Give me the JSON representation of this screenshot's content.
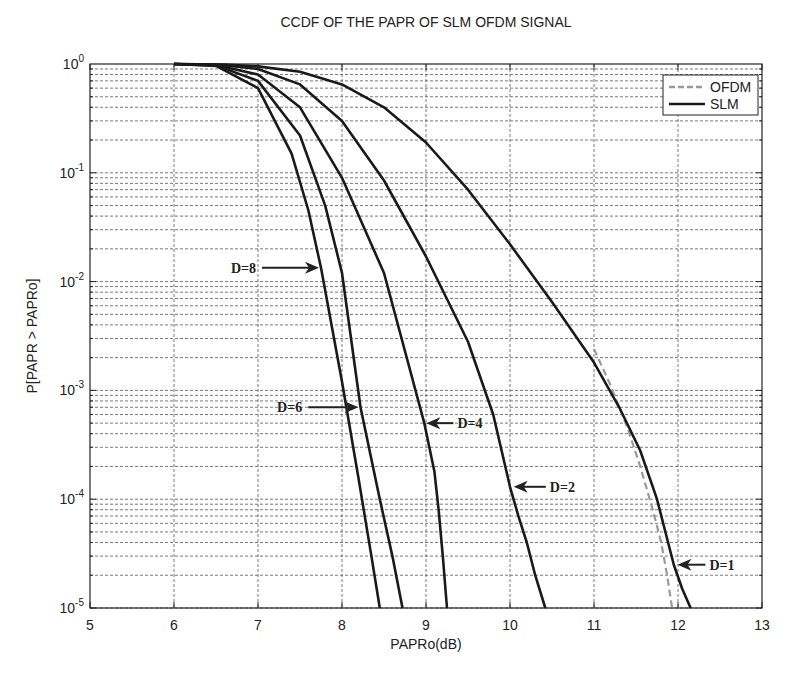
{
  "chart_data": {
    "type": "line",
    "title": "CCDF OF THE PAPR OF SLM OFDM SIGNAL",
    "xlabel": "PAPRo(dB)",
    "ylabel": "P[PAPR > PAPRo]",
    "xlim": [
      5,
      13
    ],
    "ylim": [
      1e-05,
      1
    ],
    "yscale": "log",
    "grid": true,
    "x_ticks": [
      "5",
      "6",
      "7",
      "8",
      "9",
      "10",
      "11",
      "12",
      "13"
    ],
    "y_ticks": [
      {
        "base": "10",
        "exp": "0"
      },
      {
        "base": "10",
        "exp": "-1"
      },
      {
        "base": "10",
        "exp": "-2"
      },
      {
        "base": "10",
        "exp": "-3"
      },
      {
        "base": "10",
        "exp": "-4"
      },
      {
        "base": "10",
        "exp": "-5"
      }
    ],
    "legend": {
      "position": "upper right",
      "entries": [
        {
          "label": "OFDM",
          "style": "dashed",
          "color": "#999999"
        },
        {
          "label": "SLM",
          "style": "solid",
          "color": "#1a1a1a"
        }
      ]
    },
    "series": [
      {
        "name": "OFDM",
        "style": "dashed",
        "color": "#999999",
        "points": [
          [
            11.0,
            0.0024
          ],
          [
            11.2,
            0.0011
          ],
          [
            11.4,
            0.00045
          ],
          [
            11.55,
            0.0002
          ],
          [
            11.7,
            8e-05
          ],
          [
            11.8,
            4e-05
          ],
          [
            11.87,
            2e-05
          ],
          [
            11.93,
            1e-05
          ]
        ]
      },
      {
        "name": "SLM D=1",
        "style": "solid",
        "color": "#1a1a1a",
        "points": [
          [
            6.0,
            1.0
          ],
          [
            6.6,
            0.99
          ],
          [
            7.0,
            0.95
          ],
          [
            7.5,
            0.85
          ],
          [
            8.0,
            0.65
          ],
          [
            8.5,
            0.4
          ],
          [
            9.0,
            0.19
          ],
          [
            9.5,
            0.07
          ],
          [
            10.0,
            0.022
          ],
          [
            10.5,
            0.0065
          ],
          [
            11.0,
            0.0018
          ],
          [
            11.3,
            0.0007
          ],
          [
            11.55,
            0.00028
          ],
          [
            11.75,
            0.0001
          ],
          [
            11.85,
            5e-05
          ],
          [
            11.95,
            2.5e-05
          ],
          [
            12.05,
            1.5e-05
          ],
          [
            12.15,
            1e-05
          ]
        ]
      },
      {
        "name": "SLM D=2",
        "style": "solid",
        "color": "#1a1a1a",
        "points": [
          [
            6.0,
            1.0
          ],
          [
            6.5,
            0.99
          ],
          [
            7.0,
            0.9
          ],
          [
            7.5,
            0.65
          ],
          [
            8.0,
            0.3
          ],
          [
            8.5,
            0.085
          ],
          [
            9.0,
            0.017
          ],
          [
            9.5,
            0.0028
          ],
          [
            9.8,
            0.0006
          ],
          [
            10.0,
            0.00013
          ],
          [
            10.1,
            7e-05
          ],
          [
            10.2,
            4e-05
          ],
          [
            10.3,
            2e-05
          ],
          [
            10.42,
            1e-05
          ]
        ]
      },
      {
        "name": "SLM D=4",
        "style": "solid",
        "color": "#1a1a1a",
        "points": [
          [
            6.0,
            1.0
          ],
          [
            6.5,
            0.98
          ],
          [
            7.0,
            0.8
          ],
          [
            7.5,
            0.4
          ],
          [
            8.0,
            0.09
          ],
          [
            8.5,
            0.012
          ],
          [
            8.98,
            0.0005
          ],
          [
            9.1,
            0.00018
          ],
          [
            9.15,
            8e-05
          ],
          [
            9.2,
            3e-05
          ],
          [
            9.25,
            1e-05
          ]
        ]
      },
      {
        "name": "SLM D=6",
        "style": "solid",
        "color": "#1a1a1a",
        "points": [
          [
            6.0,
            1.0
          ],
          [
            6.5,
            0.97
          ],
          [
            7.0,
            0.7
          ],
          [
            7.5,
            0.22
          ],
          [
            7.8,
            0.05
          ],
          [
            8.0,
            0.012
          ],
          [
            8.22,
            0.0007
          ],
          [
            8.45,
            0.0001
          ],
          [
            8.6,
            3e-05
          ],
          [
            8.72,
            1e-05
          ]
        ]
      },
      {
        "name": "SLM D=8",
        "style": "solid",
        "color": "#1a1a1a",
        "points": [
          [
            6.0,
            1.0
          ],
          [
            6.5,
            0.96
          ],
          [
            7.0,
            0.6
          ],
          [
            7.4,
            0.15
          ],
          [
            7.6,
            0.045
          ],
          [
            7.75,
            0.0134
          ],
          [
            8.0,
            0.0012
          ],
          [
            8.2,
            0.00015
          ],
          [
            8.35,
            3e-05
          ],
          [
            8.45,
            1e-05
          ]
        ]
      }
    ],
    "annotations": [
      {
        "label": "D=8",
        "text_x": 7.0,
        "text_p": 0.0134,
        "arrow_to_x": 7.75,
        "arrow_dir": "right"
      },
      {
        "label": "D=6",
        "text_x": 7.55,
        "text_p": 0.0007,
        "arrow_to_x": 8.22,
        "arrow_dir": "right"
      },
      {
        "label": "D=4",
        "text_x": 9.35,
        "text_p": 0.0005,
        "arrow_to_x": 8.98,
        "arrow_dir": "left"
      },
      {
        "label": "D=2",
        "text_x": 10.45,
        "text_p": 0.00013,
        "arrow_to_x": 10.02,
        "arrow_dir": "left"
      },
      {
        "label": "D=1",
        "text_x": 12.35,
        "text_p": 2.5e-05,
        "arrow_to_x": 11.97,
        "arrow_dir": "left"
      }
    ]
  }
}
